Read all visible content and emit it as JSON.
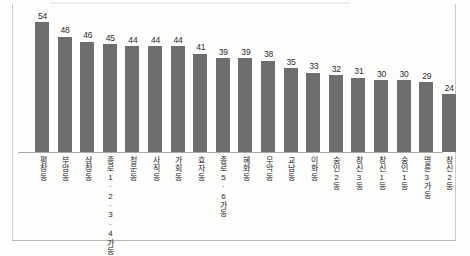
{
  "chart_data": {
    "type": "bar",
    "title": "",
    "subtitle": "",
    "xlabel": "",
    "ylabel": "",
    "ylim": [
      0,
      60
    ],
    "grid": false,
    "legend": null,
    "orientation": "vertical",
    "bar_color": "#6d6d6d",
    "value_labels_shown": true,
    "axis_tick_labels_shown": false,
    "categories": [
      "평창동",
      "부암동",
      "삼청동",
      "종로1·2·3·4가동",
      "청운동",
      "사직동",
      "가회동",
      "효자동",
      "종로5·6가동",
      "혜화동",
      "무악동",
      "교남동",
      "이화동",
      "숭인2동",
      "창신3동",
      "창신1동",
      "숭인1동",
      "명륜3가동",
      "창신2동"
    ],
    "values": [
      54,
      48,
      46,
      45,
      44,
      44,
      44,
      41,
      39,
      39,
      38,
      35,
      33,
      32,
      31,
      30,
      30,
      29,
      24
    ]
  }
}
